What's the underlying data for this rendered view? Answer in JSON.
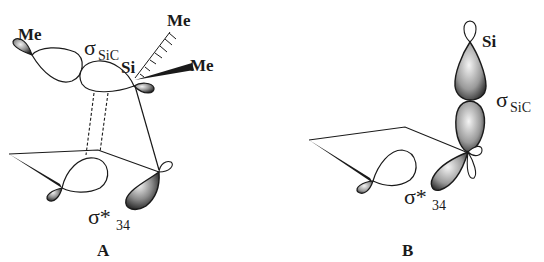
{
  "figure": {
    "panels": [
      {
        "id": "A",
        "caption": "A",
        "labels": {
          "me_left": "Me",
          "me_top": "Me",
          "me_right": "Me",
          "si": "Si",
          "sigma_sic_main": "σ",
          "sigma_sic_sub": "SiC",
          "sigma_star_main": "σ*",
          "sigma_star_sub": "34"
        }
      },
      {
        "id": "B",
        "caption": "B",
        "labels": {
          "si": "Si",
          "sigma_sic_main": "σ",
          "sigma_sic_sub": "SiC",
          "sigma_star_main": "σ*",
          "sigma_star_sub": "34"
        }
      }
    ],
    "colors": {
      "line": "#1a1a1a",
      "lobe_dark": "#2b2b2b",
      "lobe_light": "#d9d9d9",
      "background": "#ffffff"
    }
  }
}
